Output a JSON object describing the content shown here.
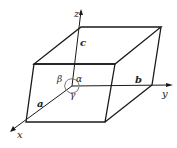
{
  "diagram": {
    "type": "unit-cell-parallelepiped",
    "colors": {
      "line": "#1a1a1a",
      "angle_arc": "#555555",
      "background": "#ffffff"
    },
    "axes": {
      "x": "x",
      "y": "y",
      "z": "z"
    },
    "edges": {
      "a": "a",
      "b": "b",
      "c": "c"
    },
    "angles": {
      "alpha": "α",
      "beta": "β",
      "gamma": "γ"
    }
  }
}
